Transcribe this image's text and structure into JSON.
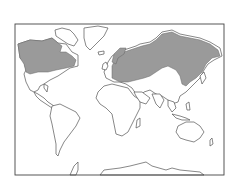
{
  "map": {
    "type": "world-distribution-map",
    "projection": "mercator-like",
    "frame": {
      "x": 15,
      "y": 24,
      "width": 209,
      "height": 151
    },
    "colors": {
      "background": "#ffffff",
      "land": "#ffffff",
      "outline": "#555555",
      "shaded_range": "#9a9a9a"
    },
    "shaded_regions": [
      {
        "name": "northern-north-america",
        "description": "Canada and Alaska (boreal zone)"
      },
      {
        "name": "northern-eurasia",
        "description": "Northern Europe through Siberia to the Pacific (boreal zone)"
      }
    ],
    "continents": [
      "North America",
      "Greenland",
      "South America",
      "Europe",
      "Africa",
      "Asia",
      "Australia",
      "Antarctica"
    ]
  }
}
